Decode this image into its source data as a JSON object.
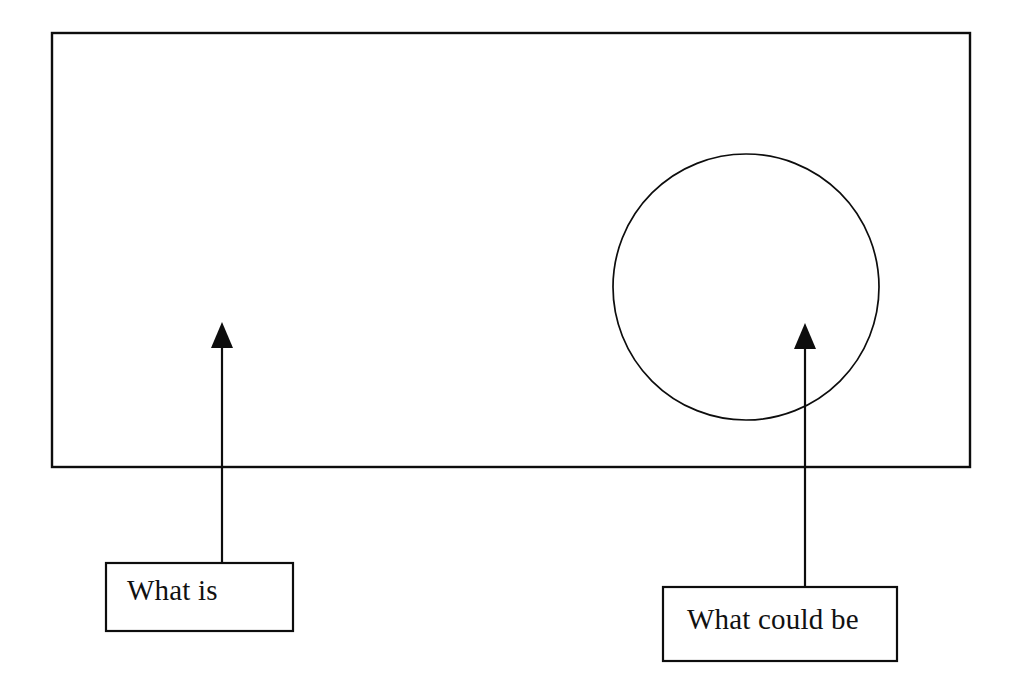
{
  "diagram": {
    "background_color": "#ffffff",
    "stroke_color": "#0d0d0d",
    "text_color": "#111111",
    "outer_frame": {
      "name": "current-state-frame",
      "shape": "rectangle",
      "x": 52,
      "y": 33,
      "width": 918,
      "height": 434,
      "stroke_width": 2.4,
      "fill": "none"
    },
    "circle": {
      "name": "possibility-circle",
      "shape": "circle",
      "center_x": 746,
      "center_y": 287,
      "radius": 133,
      "stroke_width": 1.7,
      "fill": "none"
    },
    "arrows": [
      {
        "name": "what-is-arrow",
        "points_to": "current-state-frame",
        "shaft_x": 222,
        "tip_y": 323,
        "base_y": 563,
        "head_width": 22,
        "head_height": 24,
        "direction": "up"
      },
      {
        "name": "what-could-be-arrow",
        "points_to": "possibility-circle",
        "shaft_x": 805,
        "tip_y": 324,
        "base_y": 587,
        "head_width": 22,
        "head_height": 24,
        "direction": "up"
      }
    ],
    "labels": [
      {
        "name": "what-is-label-box",
        "text": "What is",
        "x": 106,
        "y": 563,
        "width": 187,
        "height": 68,
        "text_x": 127,
        "text_baseline_y": 600
      },
      {
        "name": "what-could-be-label-box",
        "text": "What could be",
        "x": 663,
        "y": 587,
        "width": 234,
        "height": 74,
        "text_x": 687,
        "text_baseline_y": 629
      }
    ]
  }
}
